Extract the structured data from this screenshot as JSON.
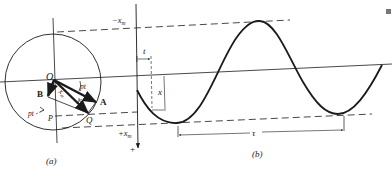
{
  "figure": {
    "panel_a": {
      "caption": "(a)",
      "labels": {
        "origin": "O",
        "vector_a": "A",
        "vector_b": "B",
        "point_q": "Q",
        "point_p": "P",
        "angle_pt_top": "pt",
        "angle_pt_left": "pt",
        "amplitude": "x",
        "amplitude_sub": "m",
        "phase": "φ"
      }
    },
    "panel_b": {
      "caption": "(b)",
      "labels": {
        "neg_amplitude": "−x",
        "neg_amplitude_sub": "m",
        "pos_amplitude": "+x",
        "pos_amplitude_sub": "m",
        "axis_positive": "+",
        "time": "t",
        "displacement": "x",
        "period": "τ"
      }
    },
    "colors": {
      "ink": "#1a1a1a",
      "background": "#ffffff"
    }
  }
}
